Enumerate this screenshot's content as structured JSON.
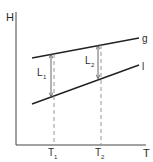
{
  "diagram": {
    "type": "enthalpy-temperature diagram",
    "axes": {
      "y_label": "H",
      "x_label": "T"
    },
    "curves": [
      {
        "name": "g",
        "label": "g",
        "description": "gas/vapor enthalpy line"
      },
      {
        "name": "l",
        "label": "l",
        "description": "liquid enthalpy line"
      }
    ],
    "temperatures": [
      {
        "label": "T",
        "subscript": "1"
      },
      {
        "label": "T",
        "subscript": "2"
      }
    ],
    "latent_heats": [
      {
        "label": "L",
        "subscript": "1",
        "at": "T1"
      },
      {
        "label": "L",
        "subscript": "2",
        "at": "T2"
      }
    ],
    "colors": {
      "ink": "#2a2a2a",
      "dashed": "#8a8a8a",
      "background": "#ffffff"
    }
  }
}
